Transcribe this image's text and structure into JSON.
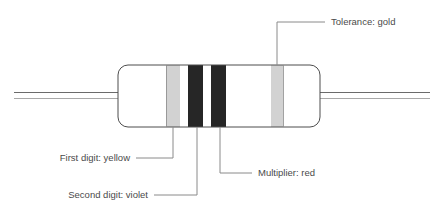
{
  "diagram": {
    "colors": {
      "background": "#ffffff",
      "outline": "#4d4d4d",
      "body_fill": "#ffffff",
      "lead_line": "#6b6b6b",
      "band_light": "#d2d2d2",
      "band_dark": "#262626",
      "leader_line": "#8a8a8a",
      "text": "#4a4a4a"
    },
    "body": {
      "x": 118,
      "y": 65,
      "width": 202,
      "height": 62,
      "corner_radius": 10
    },
    "leads": [
      {
        "name": "left-lead",
        "x1": 14,
        "x2": 124,
        "y": 92
      },
      {
        "name": "left-lead",
        "x1": 14,
        "x2": 124,
        "y": 98
      },
      {
        "name": "right-lead",
        "x1": 314,
        "x2": 430,
        "y": 92
      },
      {
        "name": "right-lead",
        "x1": 314,
        "x2": 430,
        "y": 98
      }
    ],
    "bands": [
      {
        "name": "band-first-digit",
        "semantic": "first digit",
        "color_name": "yellow",
        "swatch": "#d2d2d2",
        "x": 166,
        "width": 14
      },
      {
        "name": "band-second-digit",
        "semantic": "second digit",
        "color_name": "violet",
        "swatch": "#262626",
        "x": 188,
        "width": 15
      },
      {
        "name": "band-multiplier",
        "semantic": "multiplier",
        "color_name": "red",
        "swatch": "#262626",
        "x": 211,
        "width": 15
      },
      {
        "name": "band-tolerance",
        "semantic": "tolerance",
        "color_name": "gold",
        "swatch": "#d2d2d2",
        "x": 271,
        "width": 12
      }
    ],
    "annotations": [
      {
        "id": "tolerance",
        "label": "Tolerance: gold",
        "text_x": 331,
        "text_y": 25,
        "text_anchor": "start",
        "leader": "M 277 65 L 277 22 L 325 22",
        "band": "band-tolerance"
      },
      {
        "id": "first-digit",
        "label": "First digit: yellow",
        "text_x": 130,
        "text_y": 161,
        "text_anchor": "end",
        "leader": "M 173 127 L 173 158 L 136 158",
        "band": "band-first-digit"
      },
      {
        "id": "second-digit",
        "label": "Second digit: violet",
        "text_x": 148,
        "text_y": 198,
        "text_anchor": "end",
        "leader": "M 197 127 L 197 195 L 154 195",
        "band": "band-second-digit"
      },
      {
        "id": "multiplier",
        "label": "Multiplier: red",
        "text_x": 258,
        "text_y": 176,
        "text_anchor": "start",
        "leader": "M 220 127 L 220 173 L 252 173",
        "band": "band-multiplier"
      }
    ]
  }
}
